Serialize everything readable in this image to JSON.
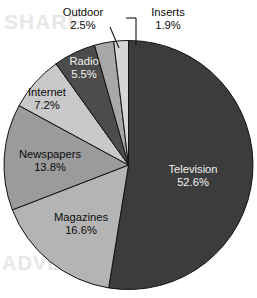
{
  "chart_data": {
    "type": "pie",
    "title": "",
    "subtitle": "",
    "xlabel": "",
    "ylabel": "",
    "legend_position": "none",
    "grid": false,
    "value_unit": "percent",
    "start_angle_deg": 0,
    "direction": "clockwise",
    "categories": [
      "Television",
      "Magazines",
      "Newspapers",
      "Internet",
      "Radio",
      "Outdoor",
      "Inserts"
    ],
    "values": [
      52.6,
      16.6,
      13.8,
      7.2,
      5.5,
      2.5,
      1.9
    ],
    "labels": [
      "52.6%",
      "16.6%",
      "13.8%",
      "7.2%",
      "5.5%",
      "2.5%",
      "1.9%"
    ],
    "colors": [
      "#3c3c3c",
      "#b4b4b4",
      "#9b9b9b",
      "#c9c9c9",
      "#4c4c4c",
      "#a8a8a8",
      "#d6d6d6"
    ],
    "slices": [
      {
        "name": "Television",
        "value": 52.6,
        "label": "52.6%",
        "color": "#3c3c3c",
        "label_placement": "inside",
        "label_on_dark": true
      },
      {
        "name": "Magazines",
        "value": 16.6,
        "label": "16.6%",
        "color": "#b4b4b4",
        "label_placement": "inside",
        "label_on_dark": false
      },
      {
        "name": "Newspapers",
        "value": 13.8,
        "label": "13.8%",
        "color": "#9b9b9b",
        "label_placement": "inside",
        "label_on_dark": false
      },
      {
        "name": "Internet",
        "value": 7.2,
        "label": "7.2%",
        "color": "#c9c9c9",
        "label_placement": "inside",
        "label_on_dark": false
      },
      {
        "name": "Radio",
        "value": 5.5,
        "label": "5.5%",
        "color": "#4c4c4c",
        "label_placement": "inside",
        "label_on_dark": true
      },
      {
        "name": "Outdoor",
        "value": 2.5,
        "label": "2.5%",
        "color": "#a8a8a8",
        "label_placement": "callout",
        "label_on_dark": false
      },
      {
        "name": "Inserts",
        "value": 1.9,
        "label": "1.9%",
        "color": "#d6d6d6",
        "label_placement": "callout",
        "label_on_dark": false
      }
    ]
  },
  "artifacts": {
    "ghost_top_text": "SHARE",
    "ghost_bottom_text": "ADVER"
  }
}
